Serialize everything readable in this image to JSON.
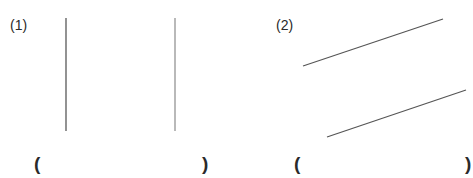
{
  "problems": [
    {
      "label": "(1)",
      "answer_open": "(",
      "answer_close": ")",
      "answer_value": "",
      "lines": [
        {
          "x1": 66,
          "y1": 18,
          "x2": 66,
          "y2": 131,
          "color": "#4a4a4a"
        },
        {
          "x1": 175,
          "y1": 18,
          "x2": 175,
          "y2": 131,
          "color": "#8a8a8a"
        }
      ]
    },
    {
      "label": "(2)",
      "answer_open": "(",
      "answer_close": ")",
      "answer_value": "",
      "lines": [
        {
          "x1": 303,
          "y1": 66,
          "x2": 443,
          "y2": 19,
          "color": "#555555"
        },
        {
          "x1": 327,
          "y1": 137,
          "x2": 466,
          "y2": 90,
          "color": "#555555"
        }
      ]
    }
  ]
}
